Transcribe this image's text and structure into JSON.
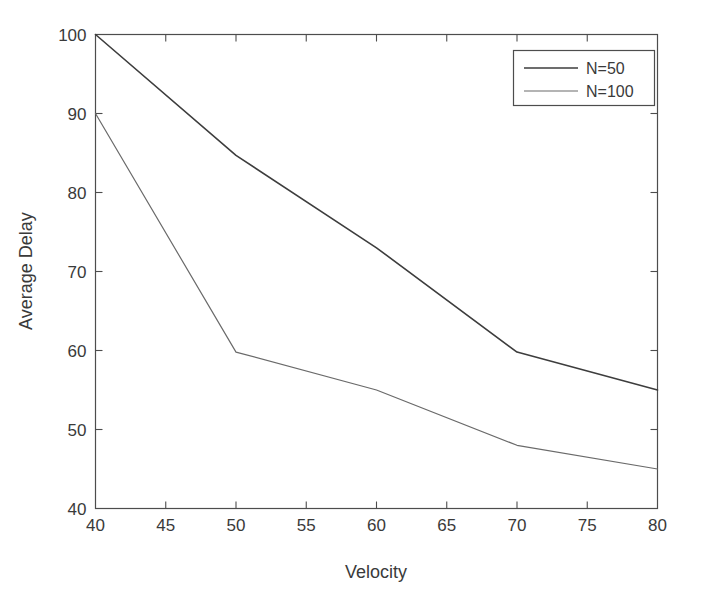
{
  "figure": {
    "background_color": "#ffffff",
    "axes_color": "#4d4d4d",
    "text_color": "#3a3a3a"
  },
  "chart_data": {
    "type": "line",
    "title": "",
    "xlabel": "Velocity",
    "ylabel": "Average Delay",
    "xlim": [
      40,
      80
    ],
    "ylim": [
      40,
      100
    ],
    "xticks": [
      40,
      45,
      50,
      55,
      60,
      65,
      70,
      75,
      80
    ],
    "xtick_labels": [
      "40",
      "45",
      "50",
      "55",
      "60",
      "65",
      "70",
      "75",
      "80"
    ],
    "yticks": [
      40,
      50,
      60,
      70,
      80,
      90,
      100
    ],
    "ytick_labels": [
      "40",
      "50",
      "60",
      "70",
      "80",
      "90",
      "100"
    ],
    "grid": false,
    "legend_position": "upper right",
    "x": [
      40,
      50,
      60,
      70,
      80
    ],
    "series": [
      {
        "name": "N=50",
        "color": "#3d3d3d",
        "width": 1.6,
        "values": [
          100,
          84.7,
          73.0,
          59.8,
          55.0
        ]
      },
      {
        "name": "N=100",
        "color": "#6a6a6a",
        "width": 1.2,
        "values": [
          90,
          59.8,
          55.0,
          48.0,
          45.0
        ]
      }
    ]
  },
  "legend": {
    "entries": [
      {
        "label": "N=50"
      },
      {
        "label": "N=100"
      }
    ]
  }
}
